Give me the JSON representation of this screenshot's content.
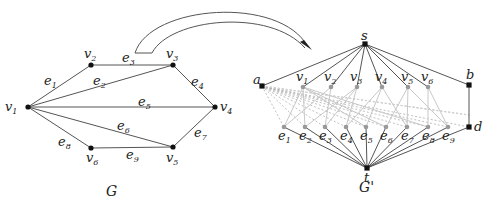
{
  "colors": {
    "edge": "#555555",
    "light_edge": "#c8c8c8",
    "dashed_edge": "#b0b0b0",
    "node": "#111111",
    "light_node": "#999999",
    "arrow_stroke": "#555555"
  },
  "graph_G": {
    "caption": "G",
    "nodes": [
      {
        "id": "v1",
        "base": "v",
        "sub": "1",
        "x": 28,
        "y": 107,
        "lx": 5,
        "ly": 111
      },
      {
        "id": "v2",
        "base": "v",
        "sub": "2",
        "x": 91,
        "y": 65,
        "lx": 84,
        "ly": 58
      },
      {
        "id": "v3",
        "base": "v",
        "sub": "3",
        "x": 173,
        "y": 65,
        "lx": 166,
        "ly": 58
      },
      {
        "id": "v4",
        "base": "v",
        "sub": "4",
        "x": 215,
        "y": 107,
        "lx": 220,
        "ly": 111
      },
      {
        "id": "v5",
        "base": "v",
        "sub": "5",
        "x": 173,
        "y": 147,
        "lx": 166,
        "ly": 162
      },
      {
        "id": "v6",
        "base": "v",
        "sub": "6",
        "x": 91,
        "y": 148,
        "lx": 86,
        "ly": 162
      }
    ],
    "edges": [
      {
        "id": "e1",
        "base": "e",
        "sub": "1",
        "from": "v1",
        "to": "v2",
        "lx": 44,
        "ly": 85
      },
      {
        "id": "e2",
        "base": "e",
        "sub": "2",
        "from": "v1",
        "to": "v3",
        "lx": 93,
        "ly": 85
      },
      {
        "id": "e3",
        "base": "e",
        "sub": "3",
        "from": "v2",
        "to": "v3",
        "lx": 122,
        "ly": 62
      },
      {
        "id": "e4",
        "base": "e",
        "sub": "4",
        "from": "v3",
        "to": "v4",
        "lx": 191,
        "ly": 86
      },
      {
        "id": "e5",
        "base": "e",
        "sub": "5",
        "from": "v1",
        "to": "v4",
        "lx": 138,
        "ly": 106
      },
      {
        "id": "e6",
        "base": "e",
        "sub": "6",
        "from": "v1",
        "to": "v5",
        "lx": 117,
        "ly": 130
      },
      {
        "id": "e7",
        "base": "e",
        "sub": "7",
        "from": "v4",
        "to": "v5",
        "lx": 194,
        "ly": 137
      },
      {
        "id": "e8",
        "base": "e",
        "sub": "8",
        "from": "v1",
        "to": "v6",
        "lx": 58,
        "ly": 146
      },
      {
        "id": "e9",
        "base": "e",
        "sub": "9",
        "from": "v5",
        "to": "v6",
        "lx": 126,
        "ly": 159
      }
    ],
    "caption_pos": {
      "x": 106,
      "y": 196
    }
  },
  "graph_G_prime": {
    "caption": "G'",
    "caption_pos": {
      "x": 359,
      "y": 192
    },
    "special_nodes": [
      {
        "id": "s",
        "label": "s",
        "x": 365,
        "y": 44,
        "lx": 361,
        "ly": 40
      },
      {
        "id": "a",
        "label": "a",
        "x": 262,
        "y": 86,
        "lx": 253,
        "ly": 84
      },
      {
        "id": "b",
        "label": "b",
        "x": 469,
        "y": 85,
        "lx": 466,
        "ly": 79
      },
      {
        "id": "d",
        "label": "d",
        "x": 469,
        "y": 127,
        "lx": 474,
        "ly": 131
      },
      {
        "id": "t",
        "label": "t",
        "x": 367,
        "y": 168,
        "lx": 364,
        "ly": 182
      }
    ],
    "vertex_nodes": [
      {
        "id": "v1",
        "base": "v",
        "sub": "1",
        "x": 303,
        "y": 87,
        "lx": 296,
        "ly": 81
      },
      {
        "id": "v2",
        "base": "v",
        "sub": "2",
        "x": 331,
        "y": 87,
        "lx": 324,
        "ly": 81
      },
      {
        "id": "v3",
        "base": "v",
        "sub": "3",
        "x": 357,
        "y": 87,
        "lx": 350,
        "ly": 81
      },
      {
        "id": "v4",
        "base": "v",
        "sub": "4",
        "x": 382,
        "y": 87,
        "lx": 375,
        "ly": 81
      },
      {
        "id": "v5",
        "base": "v",
        "sub": "5",
        "x": 408,
        "y": 87,
        "lx": 401,
        "ly": 81
      },
      {
        "id": "v6",
        "base": "v",
        "sub": "6",
        "x": 428,
        "y": 87,
        "lx": 421,
        "ly": 81
      }
    ],
    "edge_nodes": [
      {
        "id": "e1",
        "base": "e",
        "sub": "1",
        "x": 284,
        "y": 127,
        "lx": 278,
        "ly": 140,
        "ends": [
          "v1",
          "v2"
        ]
      },
      {
        "id": "e2",
        "base": "e",
        "sub": "2",
        "x": 305,
        "y": 127,
        "lx": 299,
        "ly": 140,
        "ends": [
          "v1",
          "v3"
        ]
      },
      {
        "id": "e3",
        "base": "e",
        "sub": "3",
        "x": 325,
        "y": 127,
        "lx": 319,
        "ly": 140,
        "ends": [
          "v2",
          "v3"
        ]
      },
      {
        "id": "e4",
        "base": "e",
        "sub": "4",
        "x": 346,
        "y": 127,
        "lx": 340,
        "ly": 140,
        "ends": [
          "v3",
          "v4"
        ]
      },
      {
        "id": "e5",
        "base": "e",
        "sub": "5",
        "x": 366,
        "y": 127,
        "lx": 360,
        "ly": 140,
        "ends": [
          "v1",
          "v4"
        ]
      },
      {
        "id": "e6",
        "base": "e",
        "sub": "6",
        "x": 386,
        "y": 127,
        "lx": 380,
        "ly": 140,
        "ends": [
          "v1",
          "v5"
        ]
      },
      {
        "id": "e7",
        "base": "e",
        "sub": "7",
        "x": 407,
        "y": 127,
        "lx": 401,
        "ly": 140,
        "ends": [
          "v4",
          "v5"
        ]
      },
      {
        "id": "e8",
        "base": "e",
        "sub": "8",
        "x": 428,
        "y": 127,
        "lx": 422,
        "ly": 140,
        "ends": [
          "v1",
          "v6"
        ]
      },
      {
        "id": "e9",
        "base": "e",
        "sub": "9",
        "x": 448,
        "y": 127,
        "lx": 442,
        "ly": 140,
        "ends": [
          "v5",
          "v6"
        ]
      }
    ]
  },
  "arrow": {
    "description": "hollow curved arrow from G to G'",
    "path_outer": "M 135 53 C 150 5, 280 -5, 308 47",
    "path_inner": "M 152 53 C 170 18, 270 8, 305 48",
    "tip": {
      "x": 310,
      "y": 49
    }
  }
}
